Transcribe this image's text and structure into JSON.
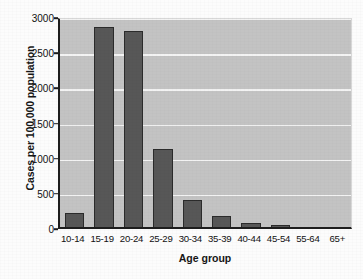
{
  "chart_data": {
    "type": "bar",
    "title": "",
    "xlabel": "Age group",
    "ylabel": "Cases per 100,000 population",
    "categories": [
      "10-14",
      "15-19",
      "20-24",
      "25-29",
      "30-34",
      "35-39",
      "40-44",
      "45-54",
      "55-64",
      "65+"
    ],
    "values": [
      195,
      2840,
      2780,
      1110,
      390,
      150,
      50,
      15,
      3,
      1
    ],
    "series": [
      {
        "name": "Cases per 100,000 population",
        "values": [
          195,
          2840,
          2780,
          1110,
          390,
          150,
          50,
          15,
          3,
          1
        ]
      }
    ],
    "ylim": [
      0,
      3000
    ],
    "yticks": [
      0,
      500,
      1000,
      1500,
      2000,
      2500,
      3000
    ],
    "ytick_labels": [
      "0",
      "500",
      "1000",
      "1500",
      "2000",
      "2500",
      "3000"
    ],
    "grid": true,
    "grid_axis": "y",
    "legend": false,
    "legend_position": "none",
    "bar_color": "#575757",
    "bar_edge_color": "#2b2b2b",
    "plot_background": "#c3c3c3",
    "grid_color": "#f3f3f3",
    "axis_color": "#1d1d1d",
    "figure_background": "#fcfcfc"
  }
}
